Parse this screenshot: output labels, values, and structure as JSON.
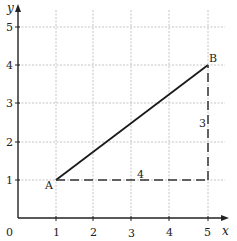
{
  "diagram": {
    "axes": {
      "x_label": "x",
      "y_label": "y",
      "origin_label": "0",
      "x_ticks": [
        "1",
        "2",
        "3",
        "4",
        "5"
      ],
      "y_ticks": [
        "1",
        "2",
        "3",
        "4",
        "5"
      ]
    },
    "points": [
      {
        "name": "A",
        "x": 1,
        "y": 1
      },
      {
        "name": "B",
        "x": 5,
        "y": 4
      }
    ],
    "segments": [
      {
        "from": "A",
        "to": "B",
        "style": "solid"
      },
      {
        "from": "A",
        "to": "C",
        "style": "dashed",
        "label": "4"
      },
      {
        "from": "C",
        "to": "B",
        "style": "dashed",
        "label": "3"
      }
    ],
    "leg_labels": {
      "horizontal": "4",
      "vertical": "3"
    },
    "colors": {
      "grid": "#b5b5b5",
      "axis": "#222222",
      "line": "#1a1a1a"
    }
  }
}
